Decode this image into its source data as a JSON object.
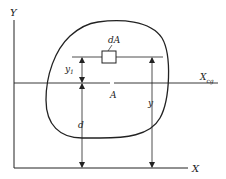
{
  "diagram": {
    "colors": {
      "stroke": "#222222",
      "background": "#ffffff"
    },
    "axes": {
      "y_label": "Y",
      "x_label": "X"
    },
    "centroid_axis": {
      "label_main": "X",
      "label_sub": "cg"
    },
    "area": {
      "label": "A"
    },
    "element": {
      "label": "dA"
    },
    "dimensions": {
      "y1_main": "y",
      "y1_sub": "1",
      "d": "d",
      "y": "y"
    }
  }
}
